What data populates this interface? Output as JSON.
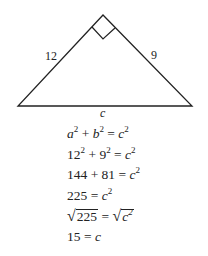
{
  "diagram": {
    "type": "right-triangle",
    "sides": {
      "left": "12",
      "right": "9",
      "base": "c"
    },
    "right_angle_marker": true
  },
  "equations": [
    {
      "parts": [
        {
          "t": "a",
          "i": true,
          "s": "2"
        },
        {
          "t": " + "
        },
        {
          "t": "b",
          "i": true,
          "s": "2"
        },
        {
          "t": " = "
        },
        {
          "t": "c",
          "i": true,
          "s": "2"
        }
      ]
    },
    {
      "parts": [
        {
          "t": "12",
          "s": "2"
        },
        {
          "t": " + "
        },
        {
          "t": "9",
          "s": "2"
        },
        {
          "t": " = "
        },
        {
          "t": "c",
          "i": true,
          "s": "2"
        }
      ]
    },
    {
      "parts": [
        {
          "t": "144 + 81 = "
        },
        {
          "t": "c",
          "i": true,
          "s": "2"
        }
      ]
    },
    {
      "parts": [
        {
          "t": "225 = "
        },
        {
          "t": "c",
          "i": true,
          "s": "2"
        }
      ]
    },
    {
      "parts": [
        {
          "sqrt": "225"
        },
        {
          "t": " = "
        },
        {
          "sqrt": "c",
          "i": true,
          "s": "2"
        }
      ]
    },
    {
      "parts": [
        {
          "t": "15 = "
        },
        {
          "t": "c",
          "i": true
        }
      ]
    }
  ]
}
